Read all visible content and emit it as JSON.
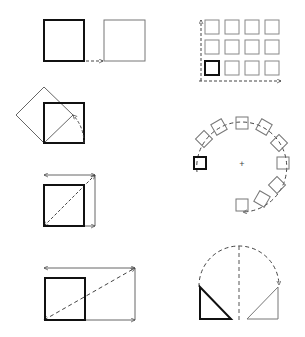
{
  "diagram": {
    "colors": {
      "background": "#ffffff",
      "bold": "#111111",
      "thin": "#666666",
      "dashed": "#444444"
    },
    "panels": [
      {
        "id": "translate",
        "label": "translate"
      },
      {
        "id": "grid-array",
        "label": "rectangular array 4x3"
      },
      {
        "id": "rotate",
        "label": "rotate 45 degrees"
      },
      {
        "id": "polar-array",
        "label": "polar array"
      },
      {
        "id": "scale-uniform",
        "label": "uniform scale"
      },
      {
        "id": "mirror",
        "label": "mirror"
      },
      {
        "id": "scale-non-uniform",
        "label": "non-uniform scale"
      }
    ],
    "grid": {
      "columns": 4,
      "rows": 3
    },
    "polar": {
      "count": 12,
      "center_marker": "+"
    }
  }
}
